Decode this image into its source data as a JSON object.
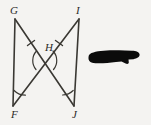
{
  "figure": {
    "type": "geometry-diagram",
    "background_color": "#f4f3f1",
    "stroke_color": "#3a3833",
    "label_color": "#2b2a28",
    "vertices": [
      {
        "name": "G",
        "label": "G",
        "x": 15,
        "y": 19,
        "label_x": 10,
        "label_y": 5
      },
      {
        "name": "I",
        "label": "I",
        "x": 79,
        "y": 19,
        "label_x": 76,
        "label_y": 5
      },
      {
        "name": "H",
        "label": "H",
        "x": 44,
        "y": 57,
        "label_x": 45,
        "label_y": 42
      },
      {
        "name": "F",
        "label": "F",
        "x": 13,
        "y": 106,
        "label_x": 11,
        "label_y": 109
      },
      {
        "name": "J",
        "label": "J",
        "x": 74,
        "y": 106,
        "label_x": 72,
        "label_y": 109
      }
    ],
    "segments": [
      {
        "name": "segment-GF",
        "from": "G",
        "to": "F",
        "x1": 15,
        "y1": 19,
        "x2": 13,
        "y2": 106
      },
      {
        "name": "segment-IJ",
        "from": "I",
        "to": "J",
        "x1": 79,
        "y1": 19,
        "x2": 74,
        "y2": 106
      },
      {
        "name": "segment-GJ",
        "from": "G",
        "to": "J",
        "x1": 15,
        "y1": 19,
        "x2": 74,
        "y2": 106
      },
      {
        "name": "segment-IF",
        "from": "I",
        "to": "F",
        "x1": 79,
        "y1": 19,
        "x2": 13,
        "y2": 106
      }
    ],
    "tick_marks": [
      {
        "name": "tick-GH",
        "on_segment": "GJ",
        "x": 31,
        "y": 43,
        "count": 1
      },
      {
        "name": "tick-IH",
        "on_segment": "IF",
        "x": 59,
        "y": 43,
        "count": 1
      }
    ],
    "angle_arcs": [
      {
        "name": "angle-arc-F",
        "at_vertex": "F"
      },
      {
        "name": "angle-arc-J",
        "at_vertex": "J"
      },
      {
        "name": "angle-arc-H-left",
        "at_vertex": "H"
      },
      {
        "name": "angle-arc-H-right",
        "at_vertex": "H"
      }
    ]
  },
  "annotation": {
    "redaction": {
      "name": "redaction-blob",
      "color": "#0b0b0b",
      "x": 88,
      "y": 49,
      "width": 52,
      "height": 19
    }
  }
}
